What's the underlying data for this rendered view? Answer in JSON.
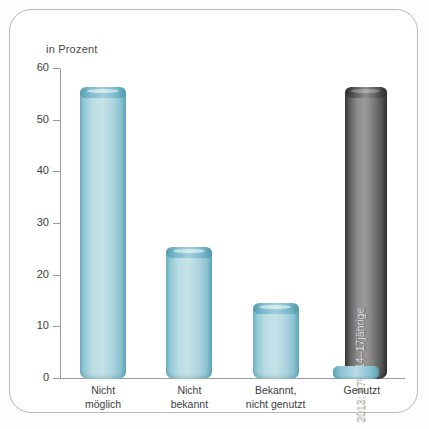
{
  "chart_data": {
    "type": "bar",
    "title": "",
    "axis_note": "in Prozent",
    "xlabel": "",
    "ylabel": "in Prozent",
    "ylim": [
      0,
      60
    ],
    "yticks": [
      0,
      10,
      20,
      30,
      40,
      50,
      60
    ],
    "grid": false,
    "legend": "none",
    "categories": [
      "Nicht\nmöglich",
      "Nicht\nbekannt",
      "Bekannt,\nnicht genutzt",
      "Genutzt"
    ],
    "category_lines": [
      [
        "Nicht",
        "möglich"
      ],
      [
        "Nicht",
        "bekannt"
      ],
      [
        "Bekannt,",
        "nicht genutzt"
      ],
      [
        "Genutzt"
      ]
    ],
    "series": [
      {
        "name": "Anteil",
        "style": "cyan-cylinder",
        "values": [
          56.5,
          25.5,
          14.7,
          1.0
        ]
      },
      {
        "name": "2013 Vergleich",
        "style": "gray-cylinder",
        "values": [
          null,
          null,
          null,
          56.5
        ]
      }
    ],
    "annotations": [
      {
        "text": "2013: 57% 14–17jährige",
        "category": "Genutzt",
        "rotation": -90,
        "inside_bar": true
      }
    ],
    "colors": {
      "bar_cyan_light": "#c6e2e8",
      "bar_cyan_edge": "#5fa7b9",
      "bar_cyan_cap": "#4f9aad",
      "bar_gray_light": "#9a9a9a",
      "bar_gray_edge": "#363636",
      "axis": "#9a9a9a",
      "text": "#3d3d3d",
      "card_border": "#b9b9b9",
      "card_background": "#ffffff"
    }
  }
}
